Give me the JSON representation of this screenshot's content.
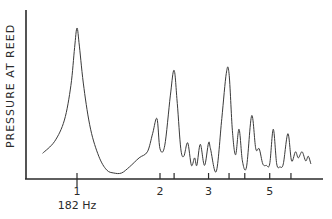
{
  "chart_data": {
    "type": "line",
    "title": "",
    "xlabel": "",
    "ylabel": "PRESSURE AT REED",
    "x_scale": "log",
    "x_unit": "harmonic of fundamental",
    "fundamental_label": "182 Hz",
    "xlim": [
      0.62,
      8.0
    ],
    "ylim": [
      0,
      1.1
    ],
    "grid": false,
    "legend": "none",
    "x_ticks": [
      {
        "value": 1,
        "label": "1"
      },
      {
        "value": 2,
        "label": "2"
      },
      {
        "value": 2.25,
        "label": ""
      },
      {
        "value": 3,
        "label": "3"
      },
      {
        "value": 3.56,
        "label": ""
      },
      {
        "value": 4.06,
        "label": ""
      },
      {
        "value": 5,
        "label": "5"
      },
      {
        "value": 5.97,
        "label": ""
      }
    ],
    "annotations": [
      {
        "text": "182 Hz",
        "at_x": 1
      }
    ],
    "series": [
      {
        "name": "pressure",
        "points": [
          [
            0.75,
            0.17
          ],
          [
            0.83,
            0.25
          ],
          [
            0.9,
            0.39
          ],
          [
            0.95,
            0.62
          ],
          [
            0.98,
            0.87
          ],
          [
            1.0,
            1.0
          ],
          [
            1.02,
            0.88
          ],
          [
            1.06,
            0.6
          ],
          [
            1.12,
            0.33
          ],
          [
            1.2,
            0.15
          ],
          [
            1.28,
            0.06
          ],
          [
            1.36,
            0.04
          ],
          [
            1.45,
            0.04
          ],
          [
            1.55,
            0.08
          ],
          [
            1.68,
            0.14
          ],
          [
            1.8,
            0.18
          ],
          [
            1.88,
            0.3
          ],
          [
            1.95,
            0.4
          ],
          [
            2.0,
            0.2
          ],
          [
            2.08,
            0.22
          ],
          [
            2.18,
            0.55
          ],
          [
            2.25,
            0.72
          ],
          [
            2.31,
            0.5
          ],
          [
            2.38,
            0.2
          ],
          [
            2.44,
            0.15
          ],
          [
            2.52,
            0.24
          ],
          [
            2.6,
            0.09
          ],
          [
            2.67,
            0.14
          ],
          [
            2.72,
            0.09
          ],
          [
            2.8,
            0.23
          ],
          [
            2.9,
            0.09
          ],
          [
            3.0,
            0.24
          ],
          [
            3.05,
            0.2
          ],
          [
            3.2,
            0.05
          ],
          [
            3.35,
            0.4
          ],
          [
            3.48,
            0.7
          ],
          [
            3.56,
            0.7
          ],
          [
            3.66,
            0.32
          ],
          [
            3.76,
            0.16
          ],
          [
            3.87,
            0.33
          ],
          [
            3.98,
            0.12
          ],
          [
            4.12,
            0.08
          ],
          [
            4.3,
            0.42
          ],
          [
            4.45,
            0.2
          ],
          [
            4.58,
            0.2
          ],
          [
            4.72,
            0.1
          ],
          [
            4.86,
            0.09
          ],
          [
            5.0,
            0.1
          ],
          [
            5.15,
            0.33
          ],
          [
            5.3,
            0.1
          ],
          [
            5.45,
            0.08
          ],
          [
            5.6,
            0.1
          ],
          [
            5.82,
            0.3
          ],
          [
            6.0,
            0.12
          ],
          [
            6.2,
            0.18
          ],
          [
            6.35,
            0.14
          ],
          [
            6.55,
            0.18
          ],
          [
            6.75,
            0.12
          ],
          [
            6.9,
            0.15
          ],
          [
            7.05,
            0.1
          ]
        ]
      }
    ]
  }
}
